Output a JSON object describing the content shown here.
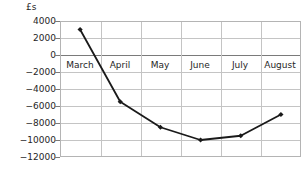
{
  "chart_data": {
    "type": "line",
    "title": "",
    "subtitle": "",
    "xlabel": "",
    "ylabel": "£s",
    "categories": [
      "March",
      "April",
      "May",
      "June",
      "July",
      "August"
    ],
    "values": [
      3000,
      -5500,
      -8500,
      -10000,
      -9500,
      -7000
    ],
    "series": [
      {
        "name": "",
        "values": [
          3000,
          -5500,
          -8500,
          -10000,
          -9500,
          -7000
        ]
      }
    ],
    "ylim": [
      -12000,
      4000
    ],
    "ytick_values": [
      4000,
      2000,
      0,
      -2000,
      -4000,
      -6000,
      -8000,
      -10000,
      -12000
    ],
    "ytick_labels": [
      "4000",
      "2000",
      "0",
      "−2000",
      "−4000",
      "−6000",
      "−8000",
      "−10000",
      "−12000"
    ],
    "grid": true,
    "legend": "none",
    "line_color": "#1a1a1a",
    "marker": "diamond",
    "marker_color": "#1a1a1a",
    "grid_color": "#c4c4c4",
    "axis_color": "#7a7a7a",
    "text_color": "#262626",
    "background_color": "#ffffff"
  }
}
